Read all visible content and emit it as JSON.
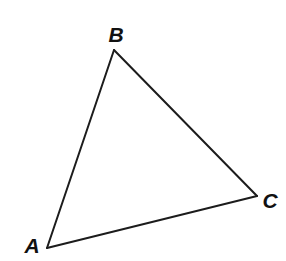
{
  "figure": {
    "kind": "geometry-diagram",
    "shape": "triangle",
    "name": "Triangle ABC",
    "background_color": "#ffffff",
    "stroke_color": "#1c1c1c",
    "stroke_width": 2,
    "label_color": "#111111",
    "canvas": {
      "width": 286,
      "height": 261
    }
  },
  "labels": {
    "a": "A",
    "b": "B",
    "c": "C"
  },
  "chart_data": {
    "type": "scatter",
    "xlabel": "",
    "ylabel": "",
    "xlim": [
      0,
      286
    ],
    "ylim": [
      0,
      261
    ],
    "grid": false,
    "legend": "none",
    "vertices": [
      {
        "label": "A",
        "x": 47,
        "y": 248,
        "label_x": 32,
        "label_y": 245
      },
      {
        "label": "B",
        "x": 114,
        "y": 50,
        "label_x": 116,
        "label_y": 34
      },
      {
        "label": "C",
        "x": 257,
        "y": 196,
        "label_x": 270,
        "label_y": 200
      }
    ],
    "edges": [
      {
        "name": "AB",
        "from": "A",
        "to": "B"
      },
      {
        "name": "BC",
        "from": "B",
        "to": "C"
      },
      {
        "name": "CA",
        "from": "C",
        "to": "A"
      }
    ],
    "polygon_points": "47,248 114,50 257,196",
    "annotations": []
  }
}
